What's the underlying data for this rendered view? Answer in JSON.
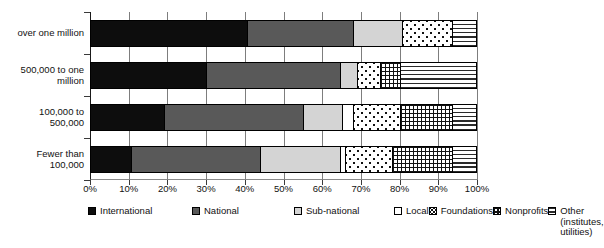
{
  "chart_data": {
    "type": "bar",
    "orientation": "horizontal",
    "stacked": true,
    "normalized_percent": true,
    "title": "",
    "subtitle": "",
    "xlabel": "",
    "ylabel": "",
    "xlim": [
      0,
      100
    ],
    "xticks": [
      "0%",
      "10%",
      "20%",
      "30%",
      "40%",
      "50%",
      "60%",
      "70%",
      "80%",
      "90%",
      "100%"
    ],
    "xtick_values": [
      0,
      10,
      20,
      30,
      40,
      50,
      60,
      70,
      80,
      90,
      100
    ],
    "grid": "vertical",
    "legend_position": "bottom",
    "categories": [
      "over one million",
      "500,000 to one\nmillion",
      "100,000 to\n500,000",
      "Fewer than\n100,000"
    ],
    "series": [
      {
        "name": "International",
        "key": "international",
        "color": "#0d0d0d",
        "pattern": "solid-black",
        "values": [
          40.5,
          30.0,
          19.0,
          10.5
        ]
      },
      {
        "name": "National",
        "key": "national",
        "color": "#595959",
        "pattern": "solid-dark-gray",
        "values": [
          27.5,
          34.5,
          36.0,
          33.5
        ]
      },
      {
        "name": "Sub-national",
        "key": "subnational",
        "color": "#d4d4d4",
        "pattern": "solid-light-gray",
        "values": [
          12.5,
          4.5,
          10.0,
          20.5
        ]
      },
      {
        "name": "Local",
        "key": "local",
        "color": "#ffffff",
        "pattern": "white",
        "values": [
          0.0,
          0.0,
          3.0,
          1.5
        ]
      },
      {
        "name": "Foundations",
        "key": "foundations",
        "color": "#ffffff",
        "pattern": "dots",
        "values": [
          13.0,
          6.0,
          12.0,
          12.0
        ]
      },
      {
        "name": "Nonprofits",
        "key": "nonprofits",
        "color": "#ffffff",
        "pattern": "grid",
        "values": [
          0.0,
          5.0,
          13.5,
          15.5
        ]
      },
      {
        "name": "Other (institutes,\nutilities)",
        "key": "other",
        "color": "#ffffff",
        "pattern": "horizontal-lines",
        "values": [
          6.5,
          20.0,
          6.5,
          6.5
        ]
      }
    ]
  },
  "legend": {
    "items": [
      {
        "label": "International",
        "pattern_class": "sw-international"
      },
      {
        "label": "National",
        "pattern_class": "sw-national"
      },
      {
        "label": "Sub-national",
        "pattern_class": "sw-subnational"
      },
      {
        "label": "Local",
        "pattern_class": "sw-local"
      },
      {
        "label": "Foundations",
        "pattern_class": "sw-foundations"
      },
      {
        "label": "Nonprofits",
        "pattern_class": "sw-nonprofits"
      },
      {
        "label": "Other (institutes,\nutilities)",
        "pattern_class": "sw-other"
      }
    ]
  }
}
